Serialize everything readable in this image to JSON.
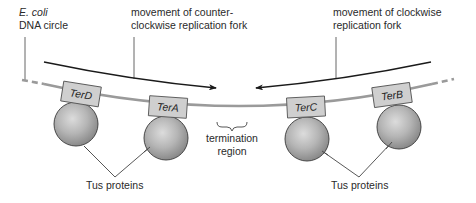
{
  "labels": {
    "organism": "E. coli",
    "dna_circle": "DNA circle",
    "ccw_fork_line1": "movement of counter-",
    "ccw_fork_line2": "clockwise replication fork",
    "cw_fork_line1": "movement of clockwise",
    "cw_fork_line2": "replication fork",
    "termination_line1": "termination",
    "termination_line2": "region",
    "tus_left": "Tus proteins",
    "tus_right": "Tus proteins"
  },
  "ter_sites": [
    {
      "name": "TerD"
    },
    {
      "name": "TerA"
    },
    {
      "name": "TerC"
    },
    {
      "name": "TerB"
    }
  ],
  "colors": {
    "dna": "#9a9a9a",
    "box_fill": "#cfcfcf",
    "box_stroke": "#555555",
    "protein_light": "#d8d8d8",
    "protein_dark": "#8e8e8e",
    "arrow": "#1a1a1a",
    "leader": "#444444"
  }
}
